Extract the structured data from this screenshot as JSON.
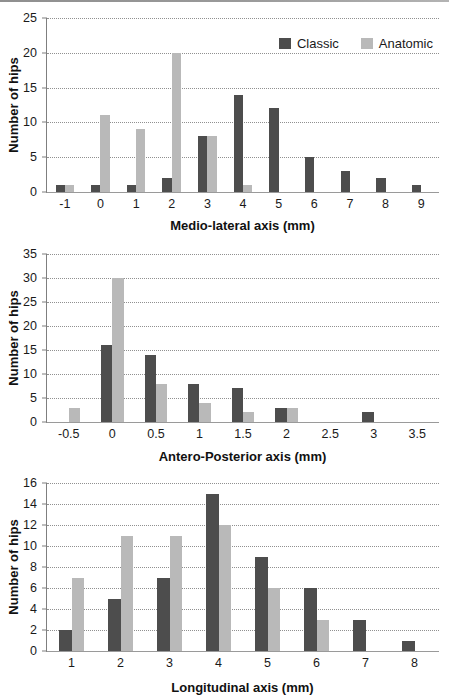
{
  "legend": {
    "classic_label": "Classic",
    "anatomic_label": "Anatomic"
  },
  "colors": {
    "classic": "#4d4d4d",
    "anatomic": "#b9b9b9",
    "gridline": "#909090",
    "axis": "#7f7f7f"
  },
  "chart_data": [
    {
      "type": "bar",
      "title": "",
      "xlabel": "Medio-lateral axis (mm)",
      "ylabel": "Number of hips",
      "categories": [
        "-1",
        "0",
        "1",
        "2",
        "3",
        "4",
        "5",
        "6",
        "7",
        "8",
        "9"
      ],
      "series": [
        {
          "name": "Classic",
          "color": "#4d4d4d",
          "values": [
            1,
            1,
            1,
            2,
            8,
            14,
            12,
            5,
            3,
            2,
            1
          ]
        },
        {
          "name": "Anatomic",
          "color": "#b9b9b9",
          "values": [
            1,
            11,
            9,
            20,
            8,
            1,
            0,
            0,
            0,
            0,
            0
          ]
        }
      ],
      "ylim": [
        0,
        25
      ],
      "yticks": [
        0,
        5,
        10,
        15,
        20,
        25
      ],
      "grid": "horizontal-dotted",
      "legend": {
        "show": true,
        "position": "top-right",
        "entries": [
          "Classic",
          "Anatomic"
        ]
      }
    },
    {
      "type": "bar",
      "title": "",
      "xlabel": "Antero-Posterior axis (mm)",
      "ylabel": "Number of hips",
      "categories": [
        "-0.5",
        "0",
        "0.5",
        "1",
        "1.5",
        "2",
        "2.5",
        "3",
        "3.5"
      ],
      "series": [
        {
          "name": "Classic",
          "color": "#4d4d4d",
          "values": [
            0,
            16,
            14,
            8,
            7,
            3,
            0,
            2,
            0
          ]
        },
        {
          "name": "Anatomic",
          "color": "#b9b9b9",
          "values": [
            3,
            30,
            8,
            4,
            2,
            3,
            0,
            0,
            0
          ]
        }
      ],
      "ylim": [
        0,
        35
      ],
      "yticks": [
        0,
        5,
        10,
        15,
        20,
        25,
        30,
        35
      ],
      "grid": "horizontal-dotted",
      "legend": {
        "show": false
      }
    },
    {
      "type": "bar",
      "title": "",
      "xlabel": "Longitudinal axis (mm)",
      "ylabel": "Number of hips",
      "categories": [
        "1",
        "2",
        "3",
        "4",
        "5",
        "6",
        "7",
        "8"
      ],
      "series": [
        {
          "name": "Classic",
          "color": "#4d4d4d",
          "values": [
            2,
            5,
            7,
            15,
            9,
            6,
            3,
            1
          ]
        },
        {
          "name": "Anatomic",
          "color": "#b9b9b9",
          "values": [
            7,
            11,
            11,
            12,
            6,
            3,
            0,
            0
          ]
        }
      ],
      "ylim": [
        0,
        16
      ],
      "yticks": [
        0,
        2,
        4,
        6,
        8,
        10,
        12,
        14,
        16
      ],
      "grid": "horizontal-dotted",
      "legend": {
        "show": false
      }
    }
  ]
}
